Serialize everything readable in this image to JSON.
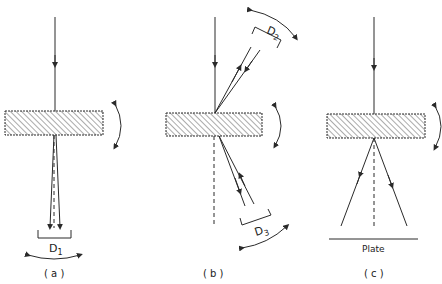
{
  "panels": [
    {
      "id": "a",
      "caption": "( a )",
      "detector_label": "D",
      "detector_sub": "1"
    },
    {
      "id": "b",
      "caption": "( b )",
      "detector_labels": [
        {
          "label": "D",
          "sub": "2"
        },
        {
          "label": "D",
          "sub": "3"
        }
      ]
    },
    {
      "id": "c",
      "caption": "( c )",
      "plate_label": "Plate"
    }
  ],
  "colors": {
    "line": "#2a2a2a",
    "background": "#ffffff"
  }
}
